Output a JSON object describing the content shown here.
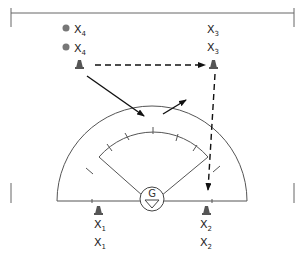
{
  "diagram": {
    "type": "drill-diagram",
    "colors": {
      "line": "#555555",
      "arrow": "#111111",
      "cone": "#444444",
      "ball": "#777777"
    },
    "goalie": {
      "label": "G"
    },
    "players": [
      {
        "id": "x4a",
        "label": "X",
        "sub": "4",
        "marker": "ball"
      },
      {
        "id": "x4b",
        "label": "X",
        "sub": "4",
        "marker": "ball"
      },
      {
        "id": "x3a",
        "label": "X",
        "sub": "3"
      },
      {
        "id": "x3b",
        "label": "X",
        "sub": "3"
      },
      {
        "id": "x1a",
        "label": "X",
        "sub": "1"
      },
      {
        "id": "x1b",
        "label": "X",
        "sub": "1"
      },
      {
        "id": "x2a",
        "label": "X",
        "sub": "2"
      },
      {
        "id": "x2b",
        "label": "X",
        "sub": "2"
      }
    ],
    "cones": [
      "top-left",
      "top-right",
      "bottom-left",
      "bottom-right"
    ],
    "movements": [
      {
        "from": "top-left-cone",
        "to": "top-right-cone",
        "style": "dashed",
        "meaning": "pass"
      },
      {
        "from": "top-right-cone",
        "to": "bottom-right",
        "style": "dashed",
        "meaning": "pass"
      },
      {
        "from": "top-left-cone",
        "to": "center",
        "style": "solid",
        "meaning": "run"
      },
      {
        "from": "center",
        "to": "upper-right",
        "style": "solid",
        "meaning": "run"
      }
    ]
  }
}
